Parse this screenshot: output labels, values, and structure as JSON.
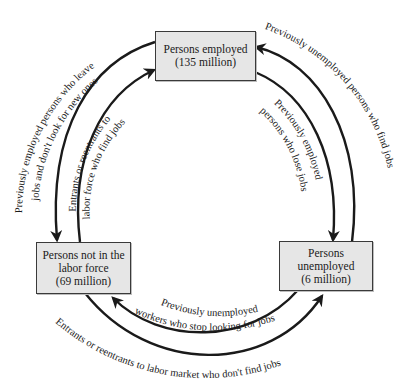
{
  "nodes": {
    "employed": {
      "line1": "Persons employed",
      "line2": "(135 million)"
    },
    "not_in_labor_force": {
      "line1": "Persons not in the",
      "line2": "labor force",
      "line3": "(69 million)"
    },
    "unemployed": {
      "line1": "Persons",
      "line2": "unemployed",
      "line3": "(6 million)"
    }
  },
  "flows": {
    "left_outer": {
      "line1": "Previously employed persons who leave",
      "line2": "jobs and don't look for new ones"
    },
    "left_inner": {
      "line1": "Entrants or reentrants to",
      "line2": "labor force who find jobs"
    },
    "right_outer": {
      "line1": "Previously unemployed persons who find jobs"
    },
    "right_inner": {
      "line1": "Previously employed",
      "line2": "persons who lose jobs"
    },
    "bottom_inner": {
      "line1": "Previously unemployed",
      "line2": "workers who stop looking for jobs"
    },
    "bottom_outer": {
      "line1": "Entrants or reentrants to labor market who don't find jobs"
    }
  },
  "colors": {
    "box_fill": "#e6e6e6",
    "line": "#1a1a1a",
    "background": "#ffffff"
  }
}
